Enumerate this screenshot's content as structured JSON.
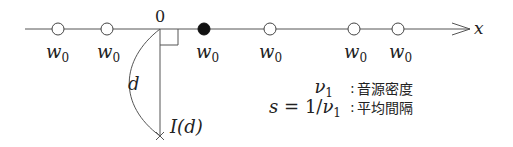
{
  "diagram": {
    "axis": {
      "label": "x",
      "origin_label": "0",
      "color": "#555555"
    },
    "sources": [
      {
        "x": 58,
        "label": "w",
        "sub": "0",
        "filled": false
      },
      {
        "x": 107,
        "label": "w",
        "sub": "0",
        "filled": false
      },
      {
        "x": 204,
        "label": "w",
        "sub": "0",
        "filled": true
      },
      {
        "x": 270,
        "label": "w",
        "sub": "0",
        "filled": false
      },
      {
        "x": 354,
        "label": "w",
        "sub": "0",
        "filled": false
      },
      {
        "x": 398,
        "label": "w",
        "sub": "0",
        "filled": false
      }
    ],
    "distance_label": "d",
    "observer_label": "I(d)",
    "legend": [
      {
        "symbol": "ν",
        "sub": "1",
        "prefix": "",
        "sep": ":",
        "description": "音源密度"
      },
      {
        "symbol": "ν",
        "sub": "1",
        "prefix": "s = 1/",
        "sep": ":",
        "description": "平均間隔"
      }
    ]
  }
}
